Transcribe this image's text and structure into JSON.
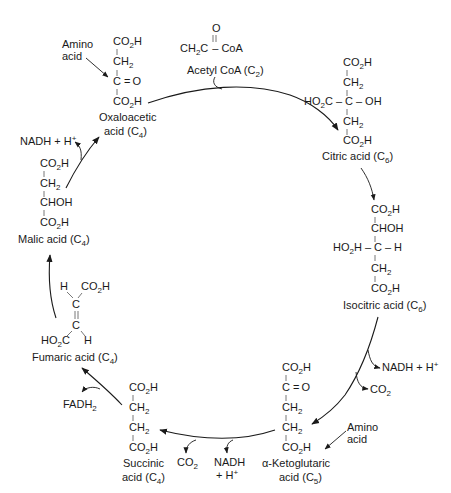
{
  "compounds": {
    "acetyl_coa": {
      "formula_top": "O",
      "formula_left": "CH",
      "formula_left_sub": "3",
      "formula_mid": "C",
      "formula_right": "CoA",
      "label": "Acetyl CoA (C",
      "label_sub": "2",
      "label_end": ")"
    },
    "oxaloacetic": {
      "lines": [
        "CO2H",
        "CH2",
        "C = O",
        "CO2H"
      ],
      "label_line1": "Oxaloacetic",
      "label_line2": "acid (C",
      "label_sub": "4",
      "label_end": ")"
    },
    "citric": {
      "lines": [
        "CO2H",
        "CH2",
        "HO2C – C – OH",
        "CH2",
        "CO2H"
      ],
      "label": "Citric acid (C",
      "label_sub": "6",
      "label_end": ")"
    },
    "isocitric": {
      "lines": [
        "CO2H",
        "CHOH",
        "HO2H – C – H",
        "CH2",
        "CO2H"
      ],
      "label": "Isocitric acid (C",
      "label_sub": "6",
      "label_end": ")"
    },
    "alpha_ketoglutaric": {
      "lines": [
        "CO2H",
        "C = O",
        "CH2",
        "CH2",
        "CO2H"
      ],
      "label_line1": "α-Ketoglutaric",
      "label_line2": "acid (C",
      "label_sub": "5",
      "label_end": ")"
    },
    "succinic": {
      "lines": [
        "CO2H",
        "CH2",
        "CH2",
        "CO2H"
      ],
      "label_line1": "Succinic",
      "label_line2": "acid (C",
      "label_sub": "4",
      "label_end": ")"
    },
    "fumaric": {
      "lines": [
        "H  CO2H",
        "C",
        "C",
        "HO2C  H"
      ],
      "label": "Fumaric acid (C",
      "label_sub": "4",
      "label_end": ")"
    },
    "malic": {
      "lines": [
        "CO2H",
        "CH2",
        "CHOH",
        "CO2H"
      ],
      "label": "Malic acid (C",
      "label_sub": "4",
      "label_end": ")"
    }
  },
  "side_products": {
    "amino_acid_top": {
      "line1": "Amino",
      "line2": "acid"
    },
    "amino_acid_bottom": {
      "line1": "Amino",
      "line2": "acid"
    },
    "nadh_isocitric": "NADH + H",
    "co2_isocitric": "CO",
    "co2_ketoglutaric": "CO",
    "nadh_ketoglutaric_line1": "NADH",
    "nadh_ketoglutaric_line2": "+ H",
    "fadh2": "FADH",
    "nadh_malic": "NADH + H"
  },
  "atoms": {
    "C": "C",
    "O": "O",
    "H": "H",
    "OH": "OH",
    "CO": "CO",
    "CH": "CH",
    "HO": "HO",
    "CHOH": "CHOH",
    "plus": "+",
    "two": "2",
    "dash": "–",
    "eq": "="
  }
}
